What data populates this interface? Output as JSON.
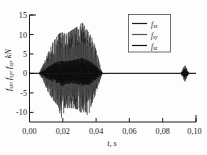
{
  "chart_data": {
    "type": "line",
    "title": "",
    "subtitle": "",
    "xlabel": "t, s",
    "ylabel": "f_sx, f_sy, f_sz, kN",
    "ylabel_parts": [
      {
        "base": "f",
        "sub": "sx"
      },
      {
        "base": "f",
        "sub": "sy"
      },
      {
        "base": "f",
        "sub": "sz"
      },
      {
        "base": "kN",
        "sub": ""
      }
    ],
    "xlim": [
      0.0,
      0.105
    ],
    "ylim": [
      -12.5,
      15
    ],
    "xticks": [
      0.0,
      0.02,
      0.04,
      0.06,
      0.08,
      0.1
    ],
    "xtick_labels": [
      "0,00",
      "0,02",
      "0,04",
      "0,06",
      "0,08",
      "0,10"
    ],
    "yticks": [
      -10,
      -5,
      0,
      5,
      10,
      15
    ],
    "ytick_labels": [
      "-10",
      "-5",
      "0",
      "5",
      "10",
      "15"
    ],
    "grid": false,
    "legend_position": "upper right",
    "series": [
      {
        "name": "f_sx",
        "label_base": "f",
        "label_sub": "sx",
        "color": "#1a1a1a",
        "envelope_scale": 1.0,
        "description": "outer broad envelope, peaks near +13 / -11.5 kN"
      },
      {
        "name": "f_sy",
        "label_base": "f",
        "label_sub": "sy",
        "color": "#4d4d4d",
        "envelope_scale": 0.62,
        "description": "mid envelope, peaks near +8 / -7 kN"
      },
      {
        "name": "f_sz",
        "label_base": "f",
        "label_sub": "sz",
        "color": "#111111",
        "envelope_scale": 0.3,
        "description": "inner dense dark band, peaks near +3.6 / -3.6 kN"
      }
    ],
    "burst": {
      "start_time": 0.006,
      "ramp_end_time": 0.012,
      "decay_start_time": 0.037,
      "end_time": 0.046,
      "peak_time": 0.033,
      "peak_value": 13.2,
      "min_value": -11.6
    },
    "secondary_burst": {
      "start_time": 0.0955,
      "end_time": 0.1005,
      "peak_value": 1.6,
      "min_value": -1.6
    },
    "envelope_profile": {
      "times": [
        0.0,
        0.006,
        0.009,
        0.012,
        0.015,
        0.018,
        0.02,
        0.023,
        0.026,
        0.029,
        0.031,
        0.033,
        0.035,
        0.037,
        0.039,
        0.041,
        0.043,
        0.045,
        0.046,
        0.05,
        0.105
      ],
      "upper": [
        0.0,
        0.0,
        2.6,
        5.6,
        8.1,
        9.9,
        10.6,
        10.1,
        10.9,
        11.7,
        12.2,
        13.2,
        12.1,
        10.7,
        9.6,
        7.4,
        4.6,
        1.3,
        0.1,
        0.02,
        0.02
      ],
      "lower": [
        0.0,
        0.0,
        -2.3,
        -5.0,
        -6.9,
        -8.3,
        -11.6,
        -9.0,
        -8.9,
        -9.1,
        -9.4,
        -10.4,
        -9.7,
        -11.2,
        -8.2,
        -6.2,
        -3.8,
        -1.1,
        -0.1,
        -0.02,
        -0.02
      ]
    }
  },
  "legend": {
    "items": [
      {
        "base": "f",
        "sub": "sx"
      },
      {
        "base": "f",
        "sub": "sy"
      },
      {
        "base": "f",
        "sub": "sz"
      }
    ]
  },
  "colors": {
    "background": "#fdfdfd",
    "axis": "#1a1a1a",
    "trace_outer": "#555555",
    "trace_inner": "#111111",
    "legend_border": "#4a4a4a"
  }
}
